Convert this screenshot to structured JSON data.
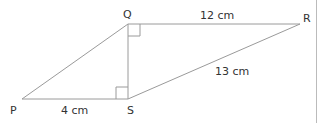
{
  "diagram": {
    "points": {
      "P": {
        "label": "P",
        "x": 22,
        "y": 99
      },
      "S": {
        "label": "S",
        "x": 128,
        "y": 99
      },
      "Q": {
        "label": "Q",
        "x": 128,
        "y": 24
      },
      "R": {
        "label": "R",
        "x": 300,
        "y": 24
      }
    },
    "measurements": {
      "PS": "4 cm",
      "QR": "12 cm",
      "SR": "13 cm"
    },
    "right_angles": [
      "Q",
      "S"
    ],
    "line_color": "#9a9a9a"
  }
}
